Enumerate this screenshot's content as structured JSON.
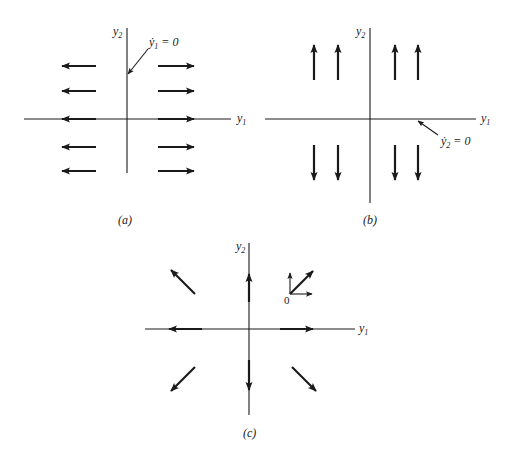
{
  "figure": {
    "panels": [
      {
        "id": "a",
        "caption": "(a)",
        "x_axis_label": "y",
        "x_axis_sub": "1",
        "y_axis_label": "y",
        "y_axis_sub": "2",
        "annotation": {
          "var": "ẏ",
          "sub": "1",
          "rest": " = 0"
        },
        "description": "Horizontal arrows pointing away from the y2 axis; y1-nullcline is the y2 axis"
      },
      {
        "id": "b",
        "caption": "(b)",
        "x_axis_label": "y",
        "x_axis_sub": "1",
        "y_axis_label": "y",
        "y_axis_sub": "2",
        "annotation": {
          "var": "ẏ",
          "sub": "2",
          "rest": " = 0"
        },
        "description": "Vertical arrows pointing away from the y1 axis; y2-nullcline is the y1 axis"
      },
      {
        "id": "c",
        "caption": "(c)",
        "x_axis_label": "y",
        "x_axis_sub": "1",
        "y_axis_label": "y",
        "y_axis_sub": "2",
        "inset_origin_label": "0",
        "description": "Combined vector field: arrows radiate outward from origin (unstable node)"
      }
    ],
    "colors": {
      "ink": "#1a1a1a",
      "background": "#ffffff"
    }
  }
}
